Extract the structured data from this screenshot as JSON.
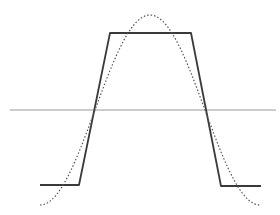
{
  "diagram": {
    "colors": {
      "background": "#ffffff",
      "axis": "#9a9a9a",
      "trapezoid": "#3a3a3a",
      "sine": "#555555"
    },
    "axis": {
      "y": 110,
      "x_start": 10,
      "x_end": 276
    },
    "trapezoid": {
      "points": [
        [
          40,
          185
        ],
        [
          79,
          185
        ],
        [
          110,
          33
        ],
        [
          191,
          33
        ],
        [
          221,
          186
        ],
        [
          261,
          186
        ]
      ]
    },
    "sine": {
      "x_start": 40,
      "x_end": 260,
      "center_y": 110,
      "amplitude": 95,
      "style": "dotted"
    }
  }
}
